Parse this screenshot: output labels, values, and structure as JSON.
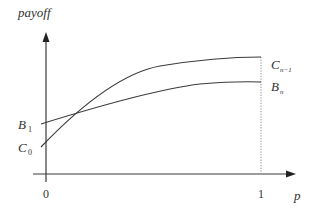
{
  "diagram": {
    "y_axis_label": "payoff",
    "x_axis_label": "p",
    "x_ticks": [
      "0",
      "1"
    ],
    "curves": [
      {
        "name": "C",
        "start_label": "C",
        "start_sub": "0",
        "end_label": "C",
        "end_sub": "n−1",
        "shape": "concave increasing"
      },
      {
        "name": "B",
        "start_label": "B",
        "start_sub": "1",
        "end_label": "B",
        "end_sub": "n",
        "shape": "concave increasing, flatter"
      }
    ],
    "colors": {
      "line": "#3a3a3a",
      "text": "#333333"
    }
  }
}
